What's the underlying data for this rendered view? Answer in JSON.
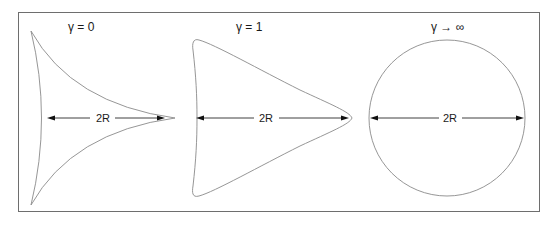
{
  "figure": {
    "panels": [
      {
        "id": "gamma-0",
        "title": "γ = 0",
        "dimension_label": "2R",
        "shape": "cusped-triangle"
      },
      {
        "id": "gamma-1",
        "title": "γ = 1",
        "dimension_label": "2R",
        "shape": "rounded-triangle"
      },
      {
        "id": "gamma-inf",
        "title": "γ → ∞",
        "dimension_label": "2R",
        "shape": "circle"
      }
    ],
    "colors": {
      "frame": "#6e6e6e",
      "curve": "#8a8a8a",
      "arrow": "#111111",
      "text": "#1a1a1a",
      "background": "#ffffff"
    }
  }
}
